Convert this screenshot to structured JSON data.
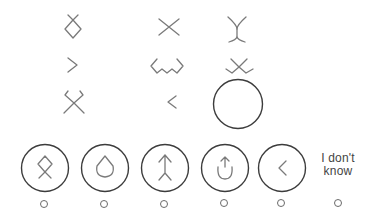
{
  "puzzle": {
    "type": "matrix-reasoning",
    "grid": [
      [
        "diamond-with-crossed-top",
        "x-cross",
        "curved-x"
      ],
      [
        "chevron-right",
        "wavy-w-with-brackets",
        "x-with-wave-bottom"
      ],
      [
        "x-with-bracket-top",
        "chevron-left",
        "missing-answer-circle"
      ]
    ]
  },
  "answers": {
    "options": [
      {
        "id": "A",
        "symbol": "diamond-crossed-bottom"
      },
      {
        "id": "B",
        "symbol": "teardrop"
      },
      {
        "id": "C",
        "symbol": "arrow-up-split-bottom"
      },
      {
        "id": "D",
        "symbol": "arrow-up-in-u"
      },
      {
        "id": "E",
        "symbol": "chevron-left"
      }
    ],
    "dont_know_label": "I don't know"
  },
  "colors": {
    "glyph_stroke": "#7a7a7a",
    "ring_stroke": "#3c3c3c",
    "background": "#ffffff"
  }
}
